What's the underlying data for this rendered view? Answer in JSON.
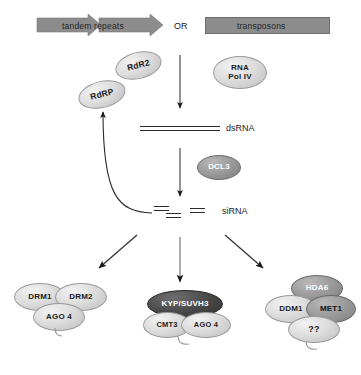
{
  "diagram": {
    "colors": {
      "bar_gray": "#8c8c8c",
      "oval_light": "#d8d8d8",
      "oval_mid": "#9a9a9a",
      "oval_dark": "#4a4a4a",
      "line_black": "#2b2b2b",
      "background": "#ffffff"
    },
    "sources": {
      "left_label": "tandem repeats",
      "connector": "OR",
      "right_label": "transposons"
    },
    "enzymes": {
      "rdr2": "RdR2",
      "rdrp": "RdRP",
      "rna_pol_iv": "RNA\nPol IV",
      "rna_pol_iv_line1": "RNA",
      "rna_pol_iv_line2": "Pol IV",
      "dcl3": "DCL3"
    },
    "intermediates": {
      "dsrna": "dsRNA",
      "sirna": "siRNA"
    },
    "complexes": [
      {
        "id": "drm-complex",
        "members": [
          "DRM1",
          "DRM2",
          "AGO 4"
        ]
      },
      {
        "id": "kyp-complex",
        "members": [
          "KYP/SUVH3",
          "CMT3",
          "AGO 4"
        ]
      },
      {
        "id": "met1-complex",
        "members": [
          "HDA6",
          "DDM1",
          "MET1",
          "??"
        ]
      }
    ],
    "complex_labels": {
      "drm1": "DRM1",
      "drm2": "DRM2",
      "ago4_left": "AGO 4",
      "kyp_suvh3": "KYP/SUVH3",
      "cmt3": "CMT3",
      "ago4_center": "AGO 4",
      "hda6": "HDA6",
      "ddm1": "DDM1",
      "met1": "MET1",
      "unknown": "??"
    },
    "arrows": {
      "transcription": "down-arrow-to-dsRNA",
      "dicing": "down-arrow-to-siRNA",
      "branch_left": "diagonal-arrow-left",
      "branch_center": "vertical-arrow-center",
      "branch_right": "diagonal-arrow-right",
      "amplification": "curved-feedback-arrow-to-RdRP"
    }
  }
}
